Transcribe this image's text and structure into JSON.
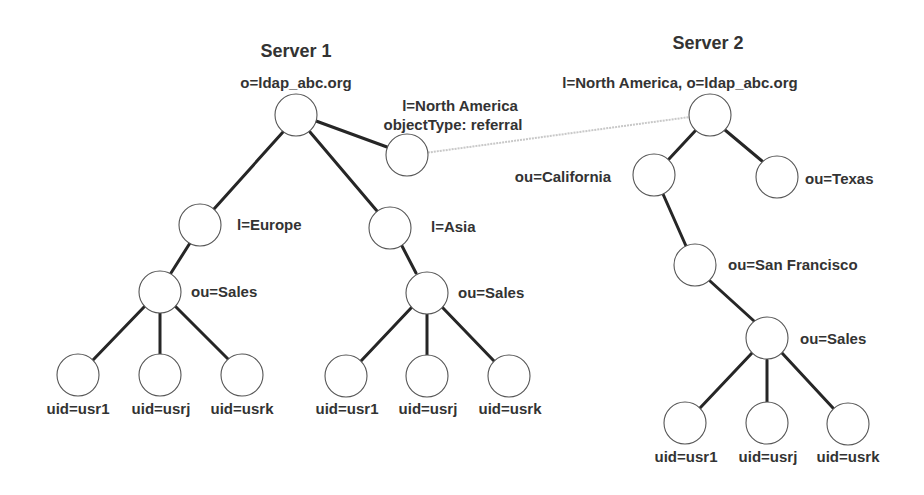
{
  "diagram": {
    "servers": [
      {
        "title": "Server 1",
        "root": {
          "label": "o=ldap_abc.org"
        },
        "referral": {
          "label_line1": "l=North America",
          "label_line2": "objectType: referral"
        },
        "branches": [
          {
            "label": "l=Europe",
            "ou": {
              "label": "ou=Sales"
            },
            "users": [
              "uid=usr1",
              "uid=usrj",
              "uid=usrk"
            ]
          },
          {
            "label": "l=Asia",
            "ou": {
              "label": "ou=Sales"
            },
            "users": [
              "uid=usr1",
              "uid=usrj",
              "uid=usrk"
            ]
          }
        ]
      },
      {
        "title": "Server 2",
        "root": {
          "label": "l=North America, o=ldap_abc.org"
        },
        "branches": [
          {
            "label": "ou=California"
          },
          {
            "label": "ou=Texas"
          }
        ],
        "city": {
          "label": "ou=San Francisco"
        },
        "ou": {
          "label": "ou=Sales"
        },
        "users": [
          "uid=usr1",
          "uid=usrj",
          "uid=usrk"
        ]
      }
    ],
    "colors": {
      "edge": "#262626",
      "referral_link": "#c8c8c8",
      "node_stroke": "#555555",
      "text": "#333333"
    }
  }
}
